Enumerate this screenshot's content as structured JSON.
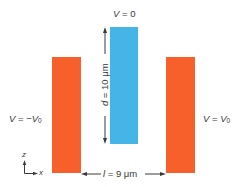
{
  "diagram": {
    "top_label": {
      "var": "V",
      "eq": " = 0"
    },
    "left_label": {
      "var": "V",
      "eq": " = −",
      "var2": "V",
      "sub": "0"
    },
    "right_label": {
      "var": "V",
      "eq": " = ",
      "var2": "V",
      "sub": "0"
    },
    "height_label": {
      "var": "d",
      "eq": " = 10 μm"
    },
    "gap_label": {
      "var": "l",
      "eq": " = 9 μm"
    },
    "axes": {
      "vertical": "z",
      "horizontal": "x"
    },
    "colors": {
      "side_electrodes": "#f7602a",
      "center_electrode": "#45b4e6",
      "text": "#3a3a3a"
    }
  }
}
